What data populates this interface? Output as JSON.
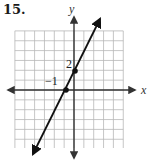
{
  "problem": {
    "number": "15."
  },
  "chart_data": {
    "type": "line",
    "title": "",
    "xlabel": "x",
    "ylabel": "y",
    "grid": true,
    "xlim": [
      -6,
      5
    ],
    "ylim": [
      -6,
      6
    ],
    "equation": "y = 2x + 2",
    "slope": 2,
    "y_intercept": 2,
    "x_intercept": -1,
    "points": [
      {
        "x": -1,
        "y": 0,
        "label": "-1"
      },
      {
        "x": 0,
        "y": 2,
        "label": "2"
      }
    ],
    "annotations": [
      "2",
      "−1"
    ]
  },
  "labels": {
    "x_axis": "x",
    "y_axis": "y",
    "point_y_intercept": "2",
    "point_x_intercept": "−1"
  },
  "colors": {
    "grid": "#b8b8b8",
    "axis": "#333333",
    "line": "#111111"
  }
}
